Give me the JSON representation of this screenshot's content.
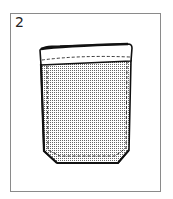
{
  "figure": {
    "step_number": "2",
    "colors": {
      "frame": "#8a8a8a",
      "outline": "#111111",
      "stitch": "#222222",
      "fabric_dots": "#555555",
      "background": "#ffffff"
    }
  }
}
